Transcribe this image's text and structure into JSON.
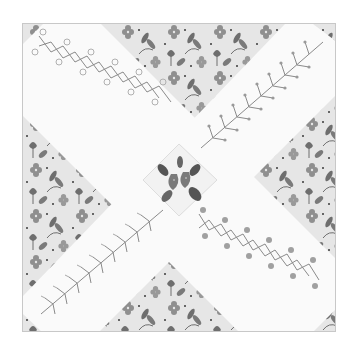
{
  "image": {
    "subject": "Quilt block with gray floral print fabric divided by two white diagonal embroidered sashing strips forming an X, with a center on-point square embroidered with strawberries and leaves",
    "background_color": "#ffffff",
    "fabric": {
      "base_color": "#e6e6e6",
      "motif_dark": "#6e6e6e",
      "motif_mid": "#8f8f8f",
      "dot_color": "#3a3a3a"
    },
    "sashing": {
      "color": "#fafafa",
      "stitch_color": "#8a8a8a",
      "arms": [
        {
          "position": "top-left",
          "stitch": "herringbone-with-loops"
        },
        {
          "position": "top-right",
          "stitch": "feather-branch"
        },
        {
          "position": "bottom-left",
          "stitch": "fern-stitch"
        },
        {
          "position": "bottom-right",
          "stitch": "cross-stitch-with-flowers"
        }
      ]
    },
    "center": {
      "motif": "strawberries-and-leaves",
      "fruit_color": "#7a7a7a",
      "leaf_color": "#555555"
    },
    "border_color": "#c8c8c8"
  }
}
